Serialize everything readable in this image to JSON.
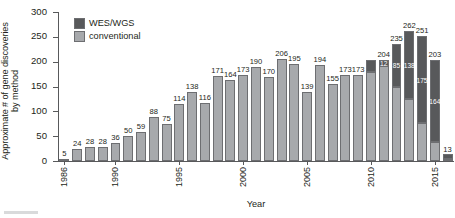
{
  "axes": {
    "ylabel_line1": "Approximate # of gene discoveries",
    "ylabel_line2": "by method",
    "xlabel": "Year",
    "yticks": [
      "0",
      "50",
      "100",
      "150",
      "200",
      "250",
      "300"
    ],
    "xticks": [
      "1986",
      "1990",
      "1995",
      "2000",
      "2005",
      "2010",
      "2015"
    ]
  },
  "legend": {
    "items": [
      {
        "label": "WES/WGS",
        "color": "#58595b"
      },
      {
        "label": "conventional",
        "color": "#a7a9ac"
      }
    ]
  },
  "chart_data": {
    "type": "bar",
    "title": "",
    "subtitle": "",
    "xlabel": "Year",
    "ylabel": "Approximate # of gene discoveries by method",
    "ylim": [
      0,
      300
    ],
    "ytick_step": 50,
    "grid": false,
    "legend_position": "top-left",
    "stacked": true,
    "colors": {
      "conventional": "#a7a9ac",
      "wes_wgs": "#58595b"
    },
    "categories": [
      "1986",
      "1987",
      "1988",
      "1989",
      "1990",
      "1991",
      "1992",
      "1993",
      "1994",
      "1995",
      "1996",
      "1997",
      "1998",
      "1999",
      "2000",
      "2001",
      "2002",
      "2003",
      "2004",
      "2005",
      "2006",
      "2007",
      "2008",
      "2009",
      "2010",
      "2011",
      "2012",
      "2013",
      "2014",
      "2015",
      "2016"
    ],
    "series": [
      {
        "name": "conventional",
        "values": [
          5,
          24,
          28,
          28,
          36,
          50,
          59,
          88,
          75,
          114,
          138,
          116,
          171,
          164,
          173,
          190,
          170,
          206,
          195,
          139,
          194,
          155,
          173,
          173,
          179,
          192,
          150,
          124,
          76,
          39,
          2
        ]
      },
      {
        "name": "WES/WGS",
        "values": [
          0,
          0,
          0,
          0,
          0,
          0,
          0,
          0,
          0,
          0,
          0,
          0,
          0,
          0,
          0,
          0,
          0,
          0,
          0,
          0,
          0,
          0,
          0,
          0,
          25,
          12,
          85,
          138,
          175,
          164,
          11
        ]
      }
    ],
    "totals": [
      5,
      24,
      28,
      28,
      36,
      50,
      59,
      88,
      75,
      114,
      138,
      116,
      171,
      164,
      173,
      190,
      170,
      206,
      195,
      139,
      194,
      155,
      173,
      173,
      204,
      204,
      235,
      262,
      251,
      203,
      13
    ],
    "total_labels": [
      "5",
      "24",
      "28",
      "28",
      "36",
      "50",
      "59",
      "88",
      "75",
      "114",
      "138",
      "116",
      "171",
      "164",
      "173",
      "190",
      "170",
      "206",
      "195",
      "139",
      "194",
      "155",
      "173",
      "173",
      "",
      "204",
      "235",
      "262",
      "251",
      "203",
      "13"
    ],
    "wes_segment_labels": [
      "",
      "",
      "",
      "",
      "",
      "",
      "",
      "",
      "",
      "",
      "",
      "",
      "",
      "",
      "",
      "",
      "",
      "",
      "",
      "",
      "",
      "",
      "",
      "",
      "",
      "12",
      "85",
      "138",
      "175",
      "164",
      ""
    ]
  }
}
